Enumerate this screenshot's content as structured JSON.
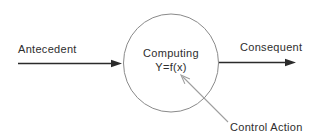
{
  "diagram": {
    "labels": {
      "antecedent": "Antecedent",
      "consequent": "Consequent",
      "node_line1": "Computing",
      "node_line2": "Y=f(x)",
      "control_action": "Control Action"
    },
    "colors": {
      "background": "#ffffff",
      "text": "#2e2e2e",
      "main_arrow": "#2b2b2b",
      "circle_stroke": "#8a8a8a",
      "control_arrow": "#9e9e9e"
    }
  }
}
